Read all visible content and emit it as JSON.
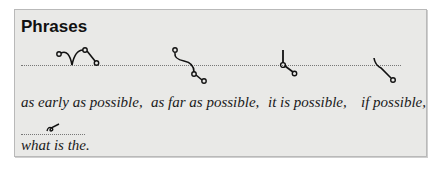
{
  "panel": {
    "title": "Phrases",
    "row1": {
      "phrases": [
        {
          "text": "as early as possible,",
          "outline_icon": "shorthand-as-early-as-possible"
        },
        {
          "text": "as far as possible,",
          "outline_icon": "shorthand-as-far-as-possible"
        },
        {
          "text": "it is possible,",
          "outline_icon": "shorthand-it-is-possible"
        },
        {
          "text": "if possible,",
          "outline_icon": "shorthand-if-possible"
        }
      ]
    },
    "row2": {
      "phrases": [
        {
          "text": "what is the.",
          "outline_icon": "shorthand-what-is-the"
        }
      ]
    }
  },
  "colors": {
    "panel_background": "#e9e9e7",
    "panel_border": "#b9b9b9",
    "ink": "#111111"
  }
}
